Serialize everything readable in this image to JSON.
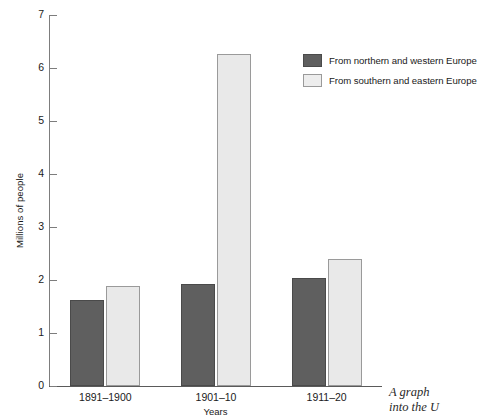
{
  "chart_data": {
    "type": "bar",
    "title": "",
    "xlabel": "Years",
    "ylabel": "Millions of people",
    "categories": [
      "1891–1900",
      "1901–10",
      "1911–20"
    ],
    "series": [
      {
        "name": "From northern and western Europe",
        "color": "#5f5f5f",
        "values": [
          1.62,
          1.92,
          2.04
        ]
      },
      {
        "name": "From southern and eastern Europe",
        "color": "#e9e9e9",
        "values": [
          1.89,
          6.26,
          2.4
        ]
      }
    ],
    "ylim": [
      0,
      7
    ],
    "yticks": [
      0,
      1,
      2,
      3,
      4,
      5,
      6,
      7
    ],
    "ytick_labels": [
      "0",
      "1",
      "2",
      "3",
      "4",
      "5",
      "6",
      "7"
    ],
    "grid": false,
    "legend_position": "top-right"
  },
  "legend": {
    "items": [
      {
        "label": "From northern and western Europe",
        "swatch": "dark"
      },
      {
        "label": "From southern and eastern Europe",
        "swatch": "light"
      }
    ]
  },
  "caption": {
    "line1": "A graph",
    "line2": "into the U"
  }
}
